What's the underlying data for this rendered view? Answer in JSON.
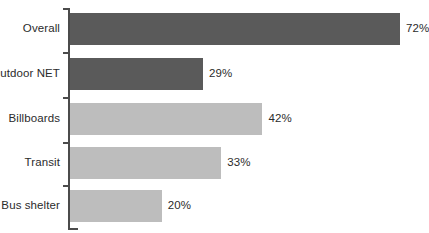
{
  "chart_data": {
    "type": "bar",
    "orientation": "horizontal",
    "title": "",
    "subtitle": "",
    "xlabel": "",
    "ylabel": "",
    "xlim": [
      0,
      72
    ],
    "grid": false,
    "legend": null,
    "value_suffix": "%",
    "categories": [
      "Overall",
      "Outdoor NET",
      "Billboards",
      "Transit",
      "Bus shelter"
    ],
    "values": [
      72,
      29,
      42,
      33,
      20
    ],
    "value_labels": [
      "72%",
      "29%",
      "42%",
      "33%",
      "20%"
    ],
    "bar_colors": [
      "#5a5a5a",
      "#5a5a5a",
      "#bdbdbd",
      "#bdbdbd",
      "#bdbdbd"
    ],
    "series": [
      {
        "name": "Percent",
        "values": [
          72,
          29,
          42,
          33,
          20
        ]
      }
    ],
    "points": [
      {
        "category": "Overall",
        "value": 72,
        "label": "72%",
        "color": "#5a5a5a"
      },
      {
        "category": "Outdoor NET",
        "value": 29,
        "label": "29%",
        "color": "#5a5a5a"
      },
      {
        "category": "Billboards",
        "value": 42,
        "label": "42%",
        "color": "#bdbdbd"
      },
      {
        "category": "Transit",
        "value": 33,
        "label": "33%",
        "color": "#bdbdbd"
      },
      {
        "category": "Bus shelter",
        "value": 20,
        "label": "20%",
        "color": "#bdbdbd"
      }
    ]
  },
  "axis": {
    "line_color": "#4b4b4b",
    "tick_count": 5
  },
  "colors": {
    "background": "#ffffff",
    "text": "#2b2b2b",
    "bar_dark": "#5a5a5a",
    "bar_light": "#bdbdbd",
    "axis": "#4b4b4b"
  },
  "layout": {
    "plot_left_px": 70,
    "px_per_unit": 4.583,
    "bar_height_px": 32,
    "row_tops_px": [
      13,
      58,
      103,
      148,
      190
    ]
  }
}
